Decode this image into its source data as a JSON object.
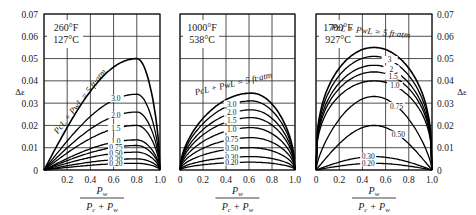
{
  "chart_data": [
    {
      "type": "line",
      "title": "260°F / 127°C",
      "temperature_label": [
        "260°F",
        "127°C"
      ],
      "xlabel": "Pw / (Pc + Pw)",
      "ylabel": "Δε",
      "xlim": [
        0,
        1.0
      ],
      "ylim": [
        0,
        0.07
      ],
      "x_ticks": [
        "0.2",
        "0.4",
        "0.6",
        "0.8",
        "1.0"
      ],
      "y_ticks": [
        "0",
        "0.01",
        "0.02",
        "0.03",
        "0.04",
        "0.05",
        "0.06",
        "0.07"
      ],
      "grid": true,
      "curve_family_label": "PcL + PwL = 5 ft·atm",
      "peak_x": 0.8,
      "series": [
        {
          "name": "5",
          "label": "PcL + PwL = 5 ft·atm",
          "peak": 0.05
        },
        {
          "name": "3.0",
          "label": "3.0",
          "peak": 0.034
        },
        {
          "name": "2.0",
          "label": "2.0",
          "peak": 0.026
        },
        {
          "name": "1.5",
          "label": "1.5",
          "peak": 0.02
        },
        {
          "name": "1.0",
          "label": "1.0",
          "peak": 0.0135
        },
        {
          "name": "0.75",
          "label": "0.75",
          "peak": 0.011
        },
        {
          "name": "0.50",
          "label": "0.50",
          "peak": 0.008
        },
        {
          "name": "0.30",
          "label": "0.30",
          "peak": 0.005
        },
        {
          "name": "0.20",
          "label": "0.20",
          "peak": 0.003
        }
      ]
    },
    {
      "type": "line",
      "title": "1000°F / 538°C",
      "temperature_label": [
        "1000°F",
        "538°C"
      ],
      "xlabel": "Pw / (Pc + Pw)",
      "ylabel": "Δε",
      "xlim": [
        0,
        1.0
      ],
      "ylim": [
        0,
        0.07
      ],
      "x_ticks": [
        "0",
        "0.2",
        "0.4",
        "0.6",
        "0.8",
        "1.0"
      ],
      "grid": true,
      "curve_family_label": "PcL + PwL = 5 ft·atm",
      "peak_x": 0.62,
      "series": [
        {
          "name": "5",
          "label": "PcL + PwL = 5 ft·atm",
          "peak": 0.0345
        },
        {
          "name": "3.0",
          "label": "3.0",
          "peak": 0.031
        },
        {
          "name": "2.0",
          "label": "2.0",
          "peak": 0.027
        },
        {
          "name": "1.5",
          "label": "1.5",
          "peak": 0.0235
        },
        {
          "name": "1.0",
          "label": "1.0",
          "peak": 0.019
        },
        {
          "name": "0.75",
          "label": "0.75",
          "peak": 0.0145
        },
        {
          "name": "0.50",
          "label": "0.50",
          "peak": 0.01
        },
        {
          "name": "0.30",
          "label": "0.30",
          "peak": 0.006
        },
        {
          "name": "0.20",
          "label": "0.20",
          "peak": 0.0035
        }
      ]
    },
    {
      "type": "line",
      "title": "1700°F / 927°C",
      "temperature_label": [
        "1700°F",
        "927°C"
      ],
      "xlabel": "Pw / (Pc + Pw)",
      "ylabel": "Δε",
      "xlim": [
        0,
        1.0
      ],
      "ylim": [
        0,
        0.07
      ],
      "x_ticks": [
        "0",
        "0.2",
        "0.4",
        "0.6",
        "0.8",
        "1.0"
      ],
      "y_ticks": [
        "0",
        "0.01",
        "0.02",
        "0.03",
        "0.04",
        "0.05",
        "0.06",
        "0.07"
      ],
      "y_axis_side": "right",
      "grid": true,
      "curve_family_label": "PcL + PwL = 5 ft·atm",
      "peak_x": 0.5,
      "series": [
        {
          "name": "5",
          "label": "PcL + PwL = 5 ft·atm",
          "peak": 0.055
        },
        {
          "name": "3",
          "label": "3",
          "peak": 0.051
        },
        {
          "name": "2",
          "label": "2",
          "peak": 0.047
        },
        {
          "name": "1.5",
          "label": "1.5",
          "peak": 0.044
        },
        {
          "name": "1.0",
          "label": "1.0",
          "peak": 0.04
        },
        {
          "name": "0.75",
          "label": "0.75",
          "peak": 0.033
        },
        {
          "name": "0.50",
          "label": "0.50",
          "peak": 0.02
        },
        {
          "name": "0.30",
          "label": "0.30",
          "peak": 0.006
        },
        {
          "name": "0.20",
          "label": "0.20",
          "peak": 0.003
        }
      ]
    }
  ],
  "axis_labels": {
    "y": "Δε",
    "x_numerator": "P",
    "x_numerator_sub": "w",
    "x_den_1": "P",
    "x_den_1_sub": "c",
    "x_den_plus": " + P",
    "x_den_2_sub": "w"
  }
}
